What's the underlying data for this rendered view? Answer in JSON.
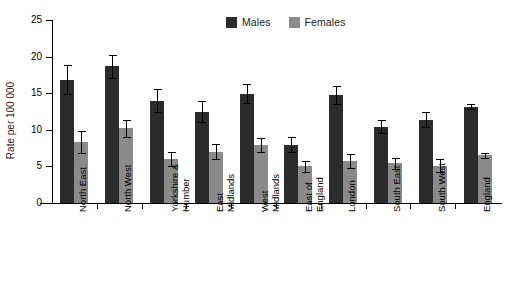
{
  "chart_data": {
    "type": "bar",
    "title": "",
    "xlabel": "",
    "ylabel": "Rate per 100 000",
    "ylim": [
      0,
      25
    ],
    "yticks": [
      0,
      5,
      10,
      15,
      20,
      25
    ],
    "grid": false,
    "legend_position": "top-center",
    "categories": [
      "North East",
      "North West",
      "Yorkshire &\nHumber",
      "East\nMidlands",
      "West\nMidlands",
      "East of\nEngland",
      "London",
      "South East",
      "South West",
      "England"
    ],
    "series": [
      {
        "name": "Males",
        "color": "#2b2b2b",
        "values": [
          16.8,
          18.7,
          14.0,
          12.4,
          14.9,
          7.9,
          14.7,
          10.4,
          11.4,
          13.1
        ],
        "err_low": [
          14.9,
          17.1,
          12.5,
          11.0,
          13.6,
          6.9,
          13.5,
          9.5,
          10.4,
          12.8
        ],
        "err_high": [
          18.8,
          20.2,
          15.6,
          13.9,
          16.2,
          9.0,
          16.0,
          11.4,
          12.5,
          13.5
        ]
      },
      {
        "name": "Females",
        "color": "#8a8a8a",
        "values": [
          8.3,
          10.2,
          6.0,
          7.0,
          7.9,
          5.0,
          5.7,
          5.4,
          5.1,
          6.5
        ],
        "err_low": [
          6.8,
          9.0,
          5.1,
          6.0,
          7.0,
          4.3,
          4.8,
          4.6,
          4.3,
          6.2
        ],
        "err_high": [
          9.9,
          11.4,
          7.0,
          8.1,
          8.9,
          5.8,
          6.7,
          6.2,
          6.0,
          6.8
        ]
      }
    ]
  },
  "legend": {
    "entries": [
      {
        "label": "Males",
        "color": "#2b2b2b"
      },
      {
        "label": "Females",
        "color": "#8a8a8a"
      }
    ]
  },
  "axes": {
    "y_title": "Rate per 100 000",
    "y_tick_labels": [
      "0",
      "5",
      "10",
      "15",
      "20",
      "25"
    ]
  }
}
